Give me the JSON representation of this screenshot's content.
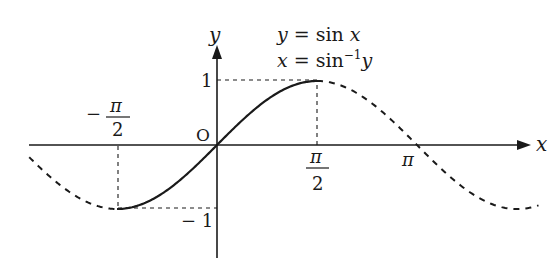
{
  "diagram": {
    "title_line1": "y = sin x",
    "title_line2_main": "x = sin",
    "title_line2_sup": "−1",
    "title_line2_var": "y",
    "axis_x_label": "x",
    "axis_y_label": "y",
    "origin_label": "O",
    "y_tick_pos": "1",
    "y_tick_neg": "− 1",
    "x_tick_neg_half_pi": {
      "sign": "−",
      "num": "π",
      "den": "2"
    },
    "x_tick_half_pi": {
      "num": "π",
      "den": "2"
    },
    "x_tick_pi": "π",
    "line_color": "#1a1a1a",
    "background": "#ffffff"
  },
  "chart_data": {
    "type": "line",
    "xlabel": "x",
    "ylabel": "y",
    "x_ticks": [
      "−π/2",
      "π/2",
      "π"
    ],
    "y_ticks": [
      "−1",
      "1"
    ],
    "xlim": [
      -3.0,
      5.1
    ],
    "ylim": [
      -1.75,
      1.55
    ],
    "grid": false,
    "series": [
      {
        "name": "sin x on [−π/2, π/2] (solid, invertible branch)",
        "style": "solid",
        "domain": [
          -1.5708,
          1.5708
        ]
      },
      {
        "name": "sin x elsewhere (dashed)",
        "style": "dashed",
        "domain": [
          -2.95,
          5.05
        ]
      }
    ],
    "key_points": [
      {
        "x": "−π/2",
        "y": -1
      },
      {
        "x": "0",
        "y": 0
      },
      {
        "x": "π/2",
        "y": 1
      },
      {
        "x": "π",
        "y": 0
      }
    ],
    "guides": [
      "dashed vertical from (−π/2,0) to (−π/2,−1)",
      "dashed horizontal from (0,−1) to (−π/2,−1)",
      "dashed vertical from (π/2,0) to (π/2,1)",
      "dashed horizontal from (0,1) to (π/2,1)"
    ]
  }
}
